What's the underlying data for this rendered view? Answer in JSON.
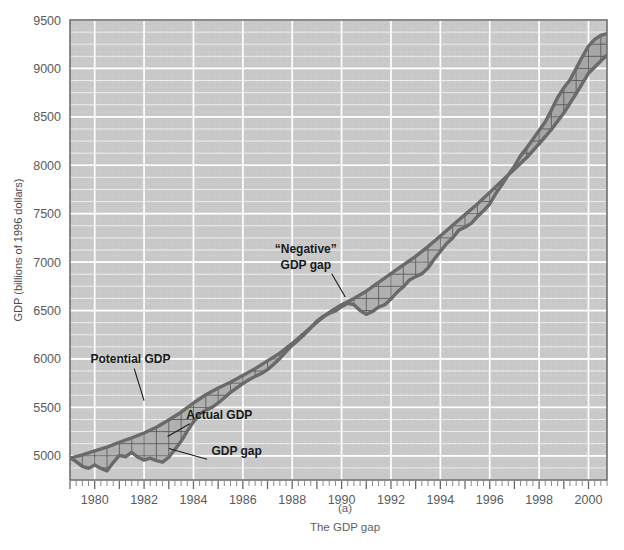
{
  "figure": {
    "caption_marker": "(a)",
    "caption_title": "The GDP gap"
  },
  "chart_data": {
    "type": "line",
    "title": "The GDP gap",
    "xlabel": "",
    "ylabel": "GDP (billions of 1996 dollars)",
    "xlim": [
      1979.0,
      2000.75
    ],
    "ylim": [
      4750,
      9500
    ],
    "yticks": [
      5000,
      5500,
      6000,
      6500,
      7000,
      7500,
      8000,
      8500,
      9000,
      9500
    ],
    "ytick_labels": [
      "5000",
      "5500",
      "6000",
      "6500",
      "7000",
      "7500",
      "8000",
      "8500",
      "9000",
      "9500"
    ],
    "y_minor_step": 125,
    "xticks": [
      1980,
      1982,
      1984,
      1986,
      1988,
      1990,
      1992,
      1994,
      1996,
      1998,
      2000
    ],
    "xtick_labels": [
      "1980",
      "1982",
      "1984",
      "1986",
      "1988",
      "1990",
      "1992",
      "1994",
      "1996",
      "1998",
      "2000"
    ],
    "x_minor_step": 0.25,
    "grid": true,
    "legend_position": "none",
    "plot_bgcolor": "#c9c9c9",
    "grid_color": "#ffffff",
    "line_color": "#6a6a6a",
    "gap_fill_color": "#9a9a9a",
    "hatch_color": "#555555",
    "series": [
      {
        "name": "Potential GDP",
        "x": [
          1979.0,
          1979.5,
          1980.0,
          1980.5,
          1981.0,
          1981.5,
          1982.0,
          1982.5,
          1983.0,
          1983.5,
          1984.0,
          1984.5,
          1985.0,
          1985.5,
          1986.0,
          1986.5,
          1987.0,
          1987.5,
          1988.0,
          1988.5,
          1989.0,
          1989.5,
          1990.0,
          1990.5,
          1991.0,
          1991.5,
          1992.0,
          1992.5,
          1993.0,
          1993.5,
          1994.0,
          1994.5,
          1995.0,
          1995.5,
          1996.0,
          1996.5,
          1997.0,
          1997.5,
          1998.0,
          1998.5,
          1999.0,
          1999.5,
          2000.0,
          2000.75
        ],
        "values": [
          4975,
          5010,
          5050,
          5090,
          5140,
          5185,
          5235,
          5295,
          5370,
          5450,
          5545,
          5630,
          5700,
          5760,
          5830,
          5900,
          5980,
          6060,
          6160,
          6270,
          6380,
          6480,
          6560,
          6625,
          6700,
          6790,
          6880,
          6970,
          7060,
          7160,
          7270,
          7380,
          7490,
          7600,
          7720,
          7840,
          7960,
          8080,
          8220,
          8370,
          8540,
          8740,
          8950,
          9140
        ]
      },
      {
        "name": "Actual GDP",
        "x": [
          1979.0,
          1979.25,
          1979.5,
          1979.75,
          1980.0,
          1980.25,
          1980.5,
          1980.75,
          1981.0,
          1981.25,
          1981.5,
          1981.75,
          1982.0,
          1982.25,
          1982.5,
          1982.75,
          1983.0,
          1983.25,
          1983.5,
          1983.75,
          1984.0,
          1984.25,
          1984.5,
          1984.75,
          1985.0,
          1985.25,
          1985.5,
          1985.75,
          1986.0,
          1986.25,
          1986.5,
          1986.75,
          1987.0,
          1987.25,
          1987.5,
          1987.75,
          1988.0,
          1988.25,
          1988.5,
          1988.75,
          1989.0,
          1989.25,
          1989.5,
          1989.75,
          1990.0,
          1990.25,
          1990.5,
          1990.75,
          1991.0,
          1991.25,
          1991.5,
          1991.75,
          1992.0,
          1992.25,
          1992.5,
          1992.75,
          1993.0,
          1993.25,
          1993.5,
          1993.75,
          1994.0,
          1994.25,
          1994.5,
          1994.75,
          1995.0,
          1995.25,
          1995.5,
          1995.75,
          1996.0,
          1996.25,
          1996.5,
          1996.75,
          1997.0,
          1997.25,
          1997.5,
          1997.75,
          1998.0,
          1998.25,
          1998.5,
          1998.75,
          1999.0,
          1999.25,
          1999.5,
          1999.75,
          2000.0,
          2000.25,
          2000.5,
          2000.75
        ],
        "values": [
          4980,
          4940,
          4890,
          4870,
          4905,
          4870,
          4845,
          4930,
          5005,
          4990,
          5035,
          4985,
          4955,
          4975,
          4950,
          4935,
          4985,
          5065,
          5150,
          5255,
          5350,
          5430,
          5470,
          5500,
          5545,
          5600,
          5655,
          5700,
          5745,
          5785,
          5820,
          5850,
          5890,
          5945,
          6005,
          6075,
          6140,
          6195,
          6255,
          6320,
          6390,
          6440,
          6470,
          6495,
          6540,
          6575,
          6560,
          6500,
          6460,
          6490,
          6535,
          6560,
          6620,
          6690,
          6745,
          6815,
          6850,
          6880,
          6940,
          7030,
          7110,
          7190,
          7250,
          7330,
          7360,
          7400,
          7470,
          7530,
          7600,
          7710,
          7800,
          7900,
          7990,
          8100,
          8180,
          8270,
          8360,
          8450,
          8570,
          8700,
          8800,
          8880,
          9000,
          9120,
          9230,
          9300,
          9340,
          9360
        ]
      }
    ],
    "annotations": [
      {
        "name": "potential-gdp",
        "text": "Potential GDP",
        "x": 1981.45,
        "y": 5960
      },
      {
        "name": "actual-gdp",
        "text": "Actual GDP",
        "x": 1985.05,
        "y": 5380
      },
      {
        "name": "gdp-gap",
        "text": "GDP gap",
        "x": 1985.75,
        "y": 5010
      },
      {
        "name": "negative-gdp-gap-line1",
        "text": "“Negative”",
        "x": 1988.55,
        "y": 7090
      },
      {
        "name": "negative-gdp-gap-line2",
        "text": "GDP gap",
        "x": 1988.55,
        "y": 6930
      }
    ]
  }
}
